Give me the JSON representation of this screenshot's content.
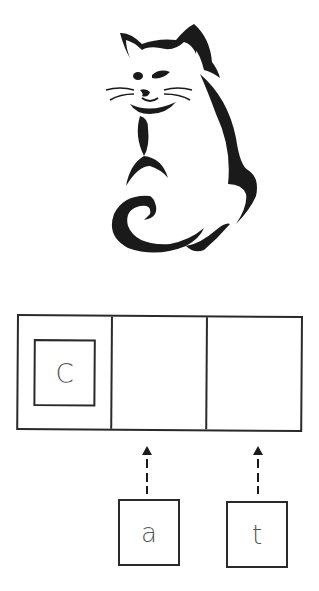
{
  "diagram": {
    "illustration": "cat-icon",
    "word_slots": [
      {
        "index": 0,
        "letter": "C",
        "filled": true
      },
      {
        "index": 1,
        "letter": "",
        "filled": false
      },
      {
        "index": 2,
        "letter": "",
        "filled": false
      }
    ],
    "pending_tiles": [
      {
        "letter": "a",
        "target_slot": 1
      },
      {
        "letter": "t",
        "target_slot": 2
      }
    ],
    "colors": {
      "stroke": "#2a2a2a",
      "letter": "#555555",
      "background": "#ffffff"
    }
  }
}
